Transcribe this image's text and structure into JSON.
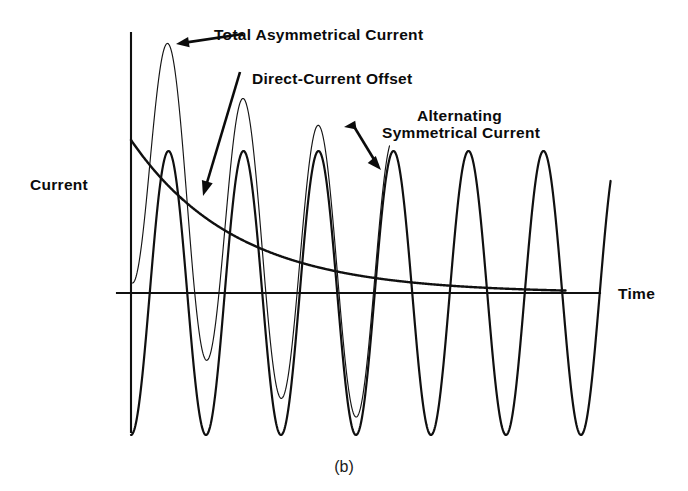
{
  "figure": {
    "caption": "(b)",
    "axis_labels": {
      "y": "Current",
      "x": "Time"
    },
    "annotations": [
      {
        "id": "total-asymmetrical-current",
        "label": "Total Asymmetrical Current"
      },
      {
        "id": "direct-current-offset",
        "label": "Direct-Current Offset"
      },
      {
        "id": "alternating-symmetrical-current-line1",
        "label": "Alternating"
      },
      {
        "id": "alternating-symmetrical-current-line2",
        "label": "Symmetrical Current"
      }
    ]
  },
  "chart_data": {
    "type": "line",
    "title": "(b)",
    "xlabel": "Time",
    "ylabel": "Current",
    "grid": false,
    "legend": "annotations",
    "axis": {
      "x_zero_px": 131,
      "y_zero_px": 293,
      "x_end_px": 600,
      "y_top_px": 33,
      "y_bottom_px": 432
    },
    "wave": {
      "period_px": 75.0,
      "cycles": 6.4,
      "ac_amplitude_px": 142,
      "dc_initial_px": 153,
      "dc_time_constant_px": 105,
      "peaks_px_x": [
        170,
        245,
        320,
        395,
        470,
        545
      ],
      "troughs_px_x": [
        208,
        283,
        358,
        433,
        508,
        583
      ]
    },
    "series": [
      {
        "name": "Alternating Symmetrical Current",
        "style": "thick",
        "description": "Pure sinusoid of constant amplitude, symmetric about the time axis",
        "equation": "i(t) = -A*cos(2*pi*t/T)",
        "amplitude": 1.0,
        "offset": 0.0
      },
      {
        "name": "Direct-Current Offset",
        "style": "thick",
        "description": "Exponentially decaying DC component from initial value toward zero",
        "equation": "i_dc(t) = A*exp(-t/tau)",
        "initial_value": 1.08,
        "final_value": 0.0
      },
      {
        "name": "Total Asymmetrical Current",
        "style": "thin",
        "description": "Sum of the symmetrical alternating current and the decaying DC offset",
        "equation": "i_total(t) = A*exp(-t/tau) - A*cos(2*pi*t/T)",
        "initial_peak": 2.0,
        "final_peak": 1.0
      }
    ],
    "annotations": [
      {
        "text": "Total Asymmetrical Current",
        "text_xy_px": [
          214,
          40
        ],
        "arrow_from_px": [
          243,
          34
        ],
        "arrow_to_px": [
          176,
          44
        ]
      },
      {
        "text": "Direct-Current Offset",
        "text_xy_px": [
          252,
          84
        ],
        "arrow_from_px": [
          240,
          72
        ],
        "arrow_to_px": [
          203,
          196
        ]
      },
      {
        "text": "Alternating",
        "text_xy_px": [
          417,
          121
        ],
        "arrow_from_px": [
          344,
          127
        ],
        "arrow_to_px": [
          381,
          170
        ]
      },
      {
        "text": "Symmetrical Current",
        "text_xy_px": [
          382,
          138
        ]
      }
    ]
  }
}
